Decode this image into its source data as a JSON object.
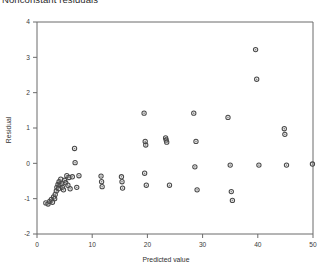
{
  "chart_data": {
    "type": "scatter",
    "title": "Nonconstant residuals",
    "xlabel": "Predicted value",
    "ylabel": "Residual",
    "xlim": [
      0,
      50
    ],
    "ylim": [
      -2,
      4
    ],
    "xticks": [
      0,
      10,
      20,
      30,
      40,
      50
    ],
    "xtick_labels": [
      "0",
      "10",
      "20",
      "30",
      "40",
      "50"
    ],
    "yticks": [
      -2,
      -1,
      0,
      1,
      2,
      3,
      4
    ],
    "ytick_labels": [
      "-2",
      "-1",
      "0",
      "1",
      "2",
      "3",
      "4"
    ],
    "grid": false,
    "legend": false,
    "marker": "open-circle",
    "marker_color": "#4a4a4a",
    "points": [
      [
        1.6,
        -1.12
      ],
      [
        2.0,
        -1.15
      ],
      [
        2.3,
        -1.08
      ],
      [
        2.6,
        -1.02
      ],
      [
        2.8,
        -1.1
      ],
      [
        3.0,
        -0.95
      ],
      [
        3.2,
        -1.0
      ],
      [
        3.3,
        -0.88
      ],
      [
        3.5,
        -0.78
      ],
      [
        3.6,
        -0.68
      ],
      [
        3.8,
        -0.6
      ],
      [
        3.9,
        -0.72
      ],
      [
        4.0,
        -0.52
      ],
      [
        4.2,
        -0.62
      ],
      [
        4.3,
        -0.45
      ],
      [
        4.5,
        -0.58
      ],
      [
        4.6,
        -0.68
      ],
      [
        4.8,
        -0.75
      ],
      [
        5.0,
        -0.48
      ],
      [
        5.2,
        -0.55
      ],
      [
        5.6,
        -0.62
      ],
      [
        6.0,
        -0.72
      ],
      [
        5.4,
        -0.35
      ],
      [
        5.8,
        -0.4
      ],
      [
        6.4,
        -0.38
      ],
      [
        7.2,
        -0.68
      ],
      [
        6.8,
        0.42
      ],
      [
        6.9,
        0.02
      ],
      [
        7.6,
        -0.35
      ],
      [
        11.6,
        -0.36
      ],
      [
        11.7,
        -0.52
      ],
      [
        11.8,
        -0.66
      ],
      [
        15.3,
        -0.38
      ],
      [
        15.4,
        -0.52
      ],
      [
        15.5,
        -0.7
      ],
      [
        19.4,
        1.42
      ],
      [
        19.6,
        0.62
      ],
      [
        19.7,
        0.52
      ],
      [
        19.5,
        -0.28
      ],
      [
        19.8,
        -0.62
      ],
      [
        23.3,
        0.72
      ],
      [
        23.4,
        0.66
      ],
      [
        23.5,
        0.6
      ],
      [
        24.0,
        -0.62
      ],
      [
        28.4,
        1.42
      ],
      [
        28.8,
        0.62
      ],
      [
        28.6,
        -0.1
      ],
      [
        29.0,
        -0.75
      ],
      [
        34.6,
        1.3
      ],
      [
        35.0,
        -0.05
      ],
      [
        35.2,
        -0.8
      ],
      [
        35.4,
        -1.05
      ],
      [
        39.6,
        3.22
      ],
      [
        39.8,
        2.38
      ],
      [
        40.2,
        -0.05
      ],
      [
        44.8,
        0.98
      ],
      [
        44.9,
        0.82
      ],
      [
        45.2,
        -0.05
      ],
      [
        49.9,
        -0.02
      ]
    ]
  }
}
